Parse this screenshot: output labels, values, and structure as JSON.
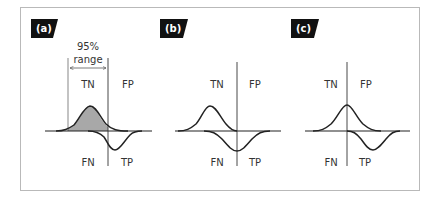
{
  "figure": {
    "colors": {
      "frame_border": "#b9b9b9",
      "badge_fill": "#111111",
      "curve_stroke": "#222222",
      "shaded_fill": "#a8a8a8",
      "guide_line": "#444444"
    },
    "panels": [
      {
        "id": "a",
        "badge": "(a)",
        "quadrant_labels": {
          "top_left": "TN",
          "top_right": "FP",
          "bottom_left": "FN",
          "bottom_right": "TP"
        },
        "range_annotation": {
          "percent": "95%",
          "word": "range"
        },
        "description": "Negative distribution peaks left of threshold with shaded 95% range; positive distribution below axis to the right"
      },
      {
        "id": "b",
        "badge": "(b)",
        "quadrant_labels": {
          "top_left": "TN",
          "top_right": "FP",
          "bottom_left": "FN",
          "bottom_right": "TP"
        },
        "description": "Threshold at end of negative distribution; positive distribution centred on threshold"
      },
      {
        "id": "c",
        "badge": "(c)",
        "quadrant_labels": {
          "top_left": "TN",
          "top_right": "FP",
          "bottom_left": "FN",
          "bottom_right": "TP"
        },
        "description": "Threshold at peak of negative distribution; positive distribution starts at threshold"
      }
    ]
  }
}
